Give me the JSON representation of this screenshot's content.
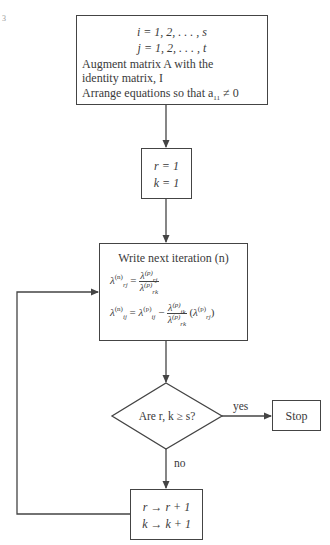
{
  "figure": {
    "corner_mark": "3",
    "colors": {
      "line": "#444444",
      "text": "#3a3a3a",
      "background": "#ffffff"
    }
  },
  "box_init": {
    "line1": "i = 1, 2, . . . , s",
    "line2": "j = 1, 2, . . . , t",
    "line3": "Augment matrix A with the",
    "line4": "identity matrix, I",
    "line5_prefix": "Arrange equations so that a",
    "line5_sub": "11",
    "line5_suffix": " ≠ 0"
  },
  "box_set": {
    "line1": "r = 1",
    "line2": "k = 1"
  },
  "box_iterate": {
    "title": "Write next iteration (n)",
    "eq1_lhs": "λ",
    "eq1_lhs_sup": "(n)",
    "eq1_lhs_sub": "rj",
    "eq1_num": "λ",
    "eq1_num_sup": "(p)",
    "eq1_num_sub": "rj",
    "eq1_den": "λ",
    "eq1_den_sup": "(p)",
    "eq1_den_sub": "rk",
    "eq2_lhs_sup": "(n)",
    "eq2_lhs_sub": "ij",
    "eq2_rhs1_sup": "(p)",
    "eq2_rhs1_sub": "ij",
    "eq2_num_sup": "(p)",
    "eq2_num_sub": "ik",
    "eq2_den_sup": "(p)",
    "eq2_den_sub": "rk",
    "eq2_tail_sup": "(p)",
    "eq2_tail_sub": "rj",
    "equals": "=",
    "minus": "−"
  },
  "decision": {
    "label": "Are r, k ≥ s?",
    "yes_label": "yes",
    "no_label": "no"
  },
  "box_stop": {
    "label": "Stop"
  },
  "box_increment": {
    "line1": "r → r + 1",
    "line2": "k → k + 1"
  }
}
